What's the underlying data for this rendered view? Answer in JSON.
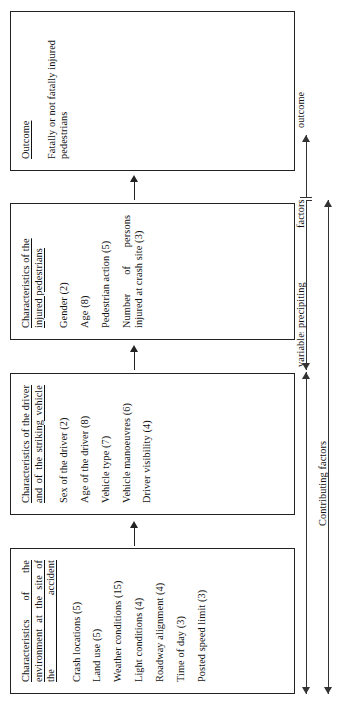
{
  "figure": {
    "title_present": false,
    "orientation": "rotated-90-ccw",
    "boxes": [
      {
        "id": "environment",
        "title": "Characteristics of the environment at the site of the accident",
        "items": [
          "Crash locations (5)",
          "Land use (5)",
          "Weather conditions (15)",
          "Light conditions (4)",
          "Roadway alignment (4)",
          "Time of day (3)",
          "Posted speed limit (3)"
        ]
      },
      {
        "id": "vehicle",
        "title": "Characteristics of the driver and of the striking vehicle",
        "items": [
          "Sex of the driver (2)",
          "Age of the driver (8)",
          "Vehicle type (7)",
          "Vehicle manoeuvres (6)",
          "Driver visibility (4)"
        ]
      },
      {
        "id": "pedestrian",
        "title": "Characteristics of the injured pedestrians",
        "items": [
          "Gender (2)",
          "Age (8)",
          "Pedestrian action (5)",
          "Number of persons injured at crash site (3)"
        ]
      },
      {
        "id": "outcome",
        "title": "Outcome",
        "body": "Fatally or not fatally injured pedestrians",
        "items": []
      }
    ],
    "flow_arrows": [
      {
        "id": "arrow-env-to-vehicle",
        "direction": "right"
      },
      {
        "id": "arrow-vehicle-to-pedestrian",
        "direction": "right"
      },
      {
        "id": "arrow-pedestrian-to-outcome",
        "direction": "right"
      }
    ],
    "axis_labels": {
      "variables": "variables",
      "precipitating": "precipiting",
      "factors": "factors",
      "outcome": "outcome",
      "contributing": "Contributing factors"
    },
    "colors": {
      "stroke": "#222222",
      "background": "#ffffff",
      "text": "#111111"
    }
  }
}
